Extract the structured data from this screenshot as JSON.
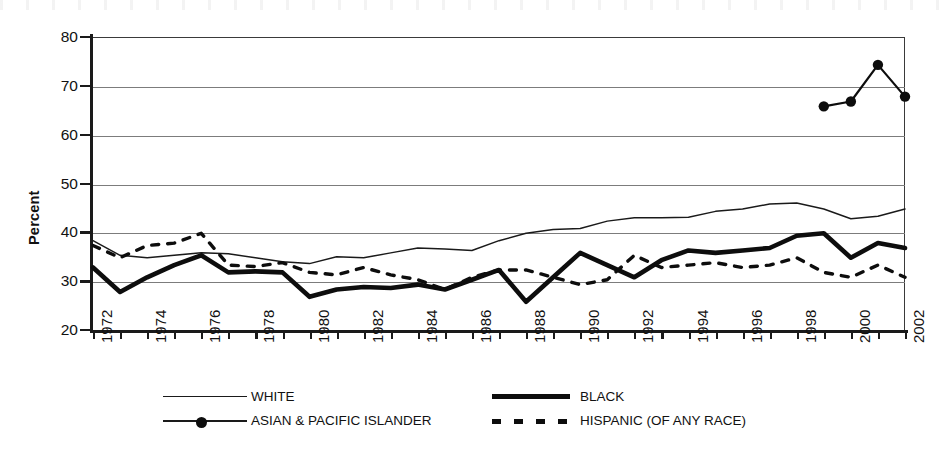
{
  "chart_data": {
    "type": "line",
    "title": "",
    "xlabel": "",
    "ylabel": "Percent",
    "ylim": [
      20,
      80
    ],
    "yticks": [
      20,
      30,
      40,
      50,
      60,
      70,
      80
    ],
    "xlim": [
      1972,
      2002
    ],
    "xticks": [
      1972,
      1974,
      1976,
      1978,
      1980,
      1982,
      1984,
      1986,
      1988,
      1990,
      1992,
      1994,
      1996,
      1998,
      2000,
      2002
    ],
    "x_tick_labels": [
      "1972",
      "1974",
      "1976",
      "1978",
      "1980",
      "1982",
      "1984",
      "1986",
      "1988",
      "1990",
      "1992",
      "1994",
      "1996",
      "1998",
      "2000",
      "2002"
    ],
    "x_all_years": [
      1972,
      1973,
      1974,
      1975,
      1976,
      1977,
      1978,
      1979,
      1980,
      1981,
      1982,
      1983,
      1984,
      1985,
      1986,
      1987,
      1988,
      1989,
      1990,
      1991,
      1992,
      1993,
      1994,
      1995,
      1996,
      1997,
      1998,
      1999,
      2000,
      2001,
      2002
    ],
    "grid": "horizontal",
    "legend_position": "below-axis",
    "series": [
      {
        "name": "WHITE",
        "style": "thin-solid",
        "color": "#1a1a1a",
        "x": [
          1972,
          1973,
          1974,
          1975,
          1976,
          1977,
          1978,
          1979,
          1980,
          1981,
          1982,
          1983,
          1984,
          1985,
          1986,
          1987,
          1988,
          1989,
          1990,
          1991,
          1992,
          1993,
          1994,
          1995,
          1996,
          1997,
          1998,
          1999,
          2000,
          2001,
          2002
        ],
        "values": [
          38.5,
          35.5,
          35.0,
          35.5,
          36.0,
          35.8,
          35.0,
          34.2,
          33.8,
          35.2,
          35.0,
          36.0,
          37.0,
          36.8,
          36.5,
          38.5,
          40.0,
          40.8,
          41.0,
          42.5,
          43.2,
          43.2,
          43.3,
          44.5,
          45.0,
          46.0,
          46.2,
          45.0,
          43.0,
          43.5,
          45.0
        ]
      },
      {
        "name": "BLACK",
        "style": "thick-solid",
        "color": "#0d0d0d",
        "x": [
          1972,
          1973,
          1974,
          1975,
          1976,
          1977,
          1978,
          1979,
          1980,
          1981,
          1982,
          1983,
          1984,
          1985,
          1986,
          1987,
          1988,
          1989,
          1990,
          1991,
          1992,
          1993,
          1994,
          1995,
          1996,
          1997,
          1998,
          1999,
          2000,
          2001,
          2002
        ],
        "values": [
          33.0,
          28.0,
          31.0,
          33.5,
          35.5,
          32.0,
          32.2,
          32.0,
          27.0,
          28.5,
          29.0,
          28.8,
          29.5,
          28.5,
          30.5,
          32.5,
          26.0,
          31.0,
          36.0,
          33.5,
          31.0,
          34.5,
          36.5,
          36.0,
          36.5,
          37.0,
          39.5,
          40.0,
          35.0,
          38.0,
          37.0
        ]
      },
      {
        "name": "ASIAN & PACIFIC ISLANDER",
        "style": "marker-line",
        "color": "#0d0d0d",
        "x": [
          1999,
          2000,
          2001,
          2002
        ],
        "values": [
          66.0,
          67.0,
          74.5,
          68.0
        ]
      },
      {
        "name": "HISPANIC (OF ANY RACE)",
        "style": "dashed",
        "color": "#0d0d0d",
        "x": [
          1972,
          1973,
          1974,
          1975,
          1976,
          1977,
          1978,
          1979,
          1980,
          1981,
          1982,
          1983,
          1984,
          1985,
          1986,
          1987,
          1988,
          1989,
          1990,
          1991,
          1992,
          1993,
          1994,
          1995,
          1996,
          1997,
          1998,
          1999,
          2000,
          2001,
          2002
        ],
        "values": [
          37.5,
          35.0,
          37.5,
          38.0,
          40.0,
          33.5,
          33.2,
          34.0,
          32.0,
          31.5,
          33.0,
          31.5,
          30.5,
          28.5,
          31.0,
          32.5,
          32.5,
          31.0,
          29.5,
          30.5,
          35.5,
          33.0,
          33.5,
          34.0,
          33.0,
          33.5,
          35.0,
          32.0,
          31.0,
          33.5,
          31.0
        ]
      }
    ]
  },
  "axis": {
    "y_title": "Percent",
    "y_labels": [
      "80",
      "70",
      "60",
      "50",
      "40",
      "30",
      "20"
    ],
    "x_labels": [
      "1972",
      "1974",
      "1976",
      "1978",
      "1980",
      "1982",
      "1984",
      "1986",
      "1988",
      "1990",
      "1992",
      "1994",
      "1996",
      "1998",
      "2000",
      "2002"
    ]
  },
  "legend": {
    "entries": [
      {
        "label": "WHITE",
        "marker": "thin-line-swatch"
      },
      {
        "label": "BLACK",
        "marker": "thick-line-swatch"
      },
      {
        "label": "ASIAN & PACIFIC ISLANDER",
        "marker": "dot-line-swatch"
      },
      {
        "label": "HISPANIC (OF ANY RACE)",
        "marker": "dashed-line-swatch"
      }
    ]
  },
  "colors": {
    "ink": "#1a1a1a",
    "grid": "#7c7c7c",
    "background": "#ffffff"
  }
}
